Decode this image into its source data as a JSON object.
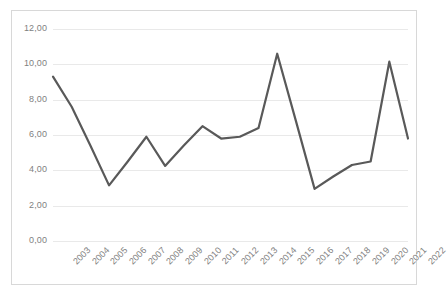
{
  "chart_data": {
    "type": "line",
    "title": "",
    "subtitle": "",
    "xlabel": "",
    "ylabel": "",
    "categories": [
      "2003",
      "2004",
      "2005",
      "2006",
      "2007",
      "2008",
      "2009",
      "2010",
      "2011",
      "2012",
      "2013",
      "2014",
      "2015",
      "2016",
      "2017",
      "2018",
      "2019",
      "2020",
      "2021",
      "2022"
    ],
    "series": [
      {
        "name": "",
        "values": [
          9.3,
          7.6,
          5.4,
          3.15,
          4.5,
          5.9,
          4.25,
          5.4,
          6.5,
          5.8,
          5.9,
          6.4,
          10.6,
          6.8,
          2.95,
          3.65,
          4.3,
          4.5,
          10.15,
          5.8
        ]
      }
    ],
    "ylim": [
      0.0,
      12.0
    ],
    "ytick_values": [
      0.0,
      2.0,
      4.0,
      6.0,
      8.0,
      10.0,
      12.0
    ],
    "ytick_labels": [
      "0,00",
      "2,00",
      "4,00",
      "6,00",
      "8,00",
      "10,00",
      "12,00"
    ],
    "grid": "horizontal",
    "legend": "none",
    "decimal_separator": ",",
    "annotations": []
  },
  "style": {
    "line_color": "#595959",
    "grid_color": "#e9e9e9",
    "tick_label_color": "#7f7f7f",
    "border_color": "#d8d8d8",
    "plot_background": "#ffffff",
    "line_width": 2.2,
    "x_label_rotation": -45
  }
}
